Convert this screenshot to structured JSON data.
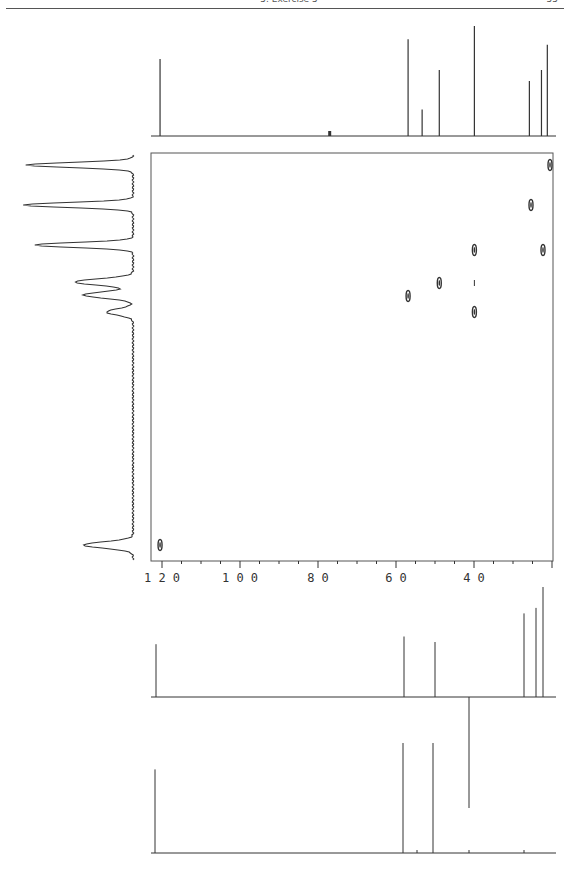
{
  "header": {
    "title": "5. Exercise 5",
    "page_number": "55"
  },
  "colors": {
    "ink": "#333333",
    "frame": "#555555",
    "background": "#ffffff"
  },
  "chart_data": [
    {
      "type": "line",
      "name": "13C broadband-decoupled spectrum (top projection)",
      "title": "",
      "xlabel": "δC (ppm)",
      "ylabel": "",
      "xlim": [
        122,
        20
      ],
      "peaks": [
        {
          "ppm": 120.5,
          "height": 0.7
        },
        {
          "ppm": 77.0,
          "height": 0.04,
          "note": "solvent (CDCl3)"
        },
        {
          "ppm": 56.9,
          "height": 0.88
        },
        {
          "ppm": 53.3,
          "height": 0.24
        },
        {
          "ppm": 48.9,
          "height": 0.6
        },
        {
          "ppm": 39.9,
          "height": 1.0
        },
        {
          "ppm": 25.8,
          "height": 0.5
        },
        {
          "ppm": 22.7,
          "height": 0.6
        },
        {
          "ppm": 21.2,
          "height": 0.83
        }
      ]
    },
    {
      "type": "line",
      "name": "1H spectrum (left projection)",
      "ylabel": "δH",
      "peaks": [
        {
          "pos_px": 165,
          "intensity": 0.97
        },
        {
          "pos_px": 205,
          "intensity": 1.0
        },
        {
          "pos_px": 245,
          "intensity": 0.9
        },
        {
          "pos_px": 282,
          "intensity": 0.53
        },
        {
          "pos_px": 295,
          "intensity": 0.45
        },
        {
          "pos_px": 312,
          "intensity": 0.24
        },
        {
          "pos_px": 545,
          "intensity": 0.45
        }
      ]
    },
    {
      "type": "scatter",
      "name": "HSQC/HETCOR 2D correlation map",
      "xlabel": "δC (ppm)",
      "x_ticks": [
        120,
        100,
        80,
        60,
        40
      ],
      "x_minor_tick_step": 5,
      "xlim": [
        122,
        20
      ],
      "grid": false,
      "cross_peaks": [
        {
          "c_ppm": 21.2,
          "h_row": 1
        },
        {
          "c_ppm": 25.8,
          "h_row": 2
        },
        {
          "c_ppm": 39.9,
          "h_row": 3
        },
        {
          "c_ppm": 22.7,
          "h_row": 3
        },
        {
          "c_ppm": 48.9,
          "h_row": 4
        },
        {
          "c_ppm": 39.9,
          "h_row": 4,
          "note": "weak"
        },
        {
          "c_ppm": 56.9,
          "h_row": 5
        },
        {
          "c_ppm": 39.9,
          "h_row": 6
        },
        {
          "c_ppm": 120.5,
          "h_row": 7
        }
      ]
    },
    {
      "type": "bar",
      "name": "DEPT-135 (CH/CH3 up, CH2 down)",
      "xlim": [
        122,
        20
      ],
      "peaks": [
        {
          "ppm": 121.0,
          "height": 0.48
        },
        {
          "ppm": 58.5,
          "height": 0.55
        },
        {
          "ppm": 50.5,
          "height": 0.5
        },
        {
          "ppm": 41.5,
          "height": -1.0
        },
        {
          "ppm": 27.5,
          "height": 0.76
        },
        {
          "ppm": 24.5,
          "height": 0.81
        },
        {
          "ppm": 22.7,
          "height": 1.0
        }
      ]
    },
    {
      "type": "bar",
      "name": "DEPT-90 (CH only)",
      "xlim": [
        122,
        20
      ],
      "peaks": [
        {
          "ppm": 121.0,
          "height": 0.76
        },
        {
          "ppm": 58.5,
          "height": 1.0
        },
        {
          "ppm": 50.5,
          "height": 1.0
        }
      ]
    }
  ]
}
